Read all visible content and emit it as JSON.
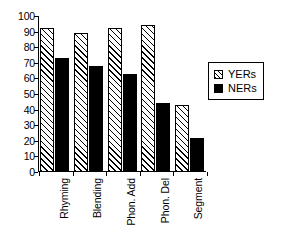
{
  "chart_data": {
    "type": "bar",
    "title": "",
    "subtitle": "",
    "xlabel": "",
    "ylabel": "",
    "categories": [
      "Rhyming",
      "Blending",
      "Phon. Add",
      "Phon. Del",
      "Segment"
    ],
    "series": [
      {
        "name": "YERs",
        "values": [
          92,
          89,
          92.5,
          94.5,
          43
        ],
        "fill": "diagonal-hatch",
        "color": "#ffffff"
      },
      {
        "name": "NERs",
        "values": [
          73,
          68,
          63,
          44,
          21.5
        ],
        "fill": "solid",
        "color": "#000000"
      }
    ],
    "ylim": [
      0,
      100
    ],
    "ytick_values": [
      0,
      10,
      20,
      30,
      40,
      50,
      60,
      70,
      80,
      90,
      100
    ],
    "ytick_labels": [
      "0",
      "10",
      "20",
      "30",
      "40",
      "50",
      "60",
      "70",
      "80",
      "90",
      "100"
    ],
    "grid": false,
    "legend_position": "right",
    "xtick_label_rotation": 90
  },
  "legend": {
    "entries": [
      {
        "label": "YERs",
        "swatch": "hatched-square-icon"
      },
      {
        "label": "NERs",
        "swatch": "filled-square-icon"
      }
    ]
  }
}
